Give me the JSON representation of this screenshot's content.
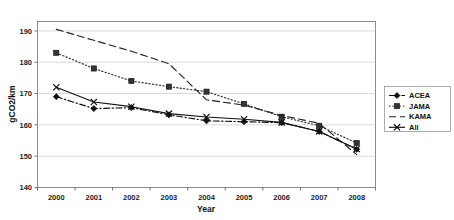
{
  "chart_data": {
    "type": "line",
    "title": "",
    "xlabel": "Year",
    "ylabel": "gCO2/km",
    "x": [
      2000,
      2001,
      2002,
      2003,
      2004,
      2005,
      2006,
      2007,
      2008
    ],
    "xtick_labels": [
      "2000",
      "2001",
      "2002",
      "2003",
      "2004",
      "2005",
      "2006",
      "2007",
      "2008"
    ],
    "ytick_labels": [
      "140",
      "150",
      "160",
      "170",
      "180",
      "190"
    ],
    "yticks": [
      140,
      150,
      160,
      170,
      180,
      190
    ],
    "ylim": [
      140,
      193
    ],
    "grid": "horizontal",
    "legend_position": "right",
    "series": [
      {
        "name": "ACEA",
        "marker": "diamond",
        "linestyle": "dashdot",
        "color": "#111111",
        "values": [
          169.0,
          165.2,
          165.5,
          163.2,
          161.3,
          161.0,
          160.7,
          157.9,
          152.2
        ]
      },
      {
        "name": "JAMA",
        "marker": "square",
        "linestyle": "dotted",
        "color": "#333333",
        "values": [
          183.0,
          178.0,
          174.0,
          172.2,
          170.6,
          166.7,
          162.6,
          159.7,
          154.2
        ]
      },
      {
        "name": "KAMA",
        "marker": "none",
        "linestyle": "dashed",
        "color": "#222222",
        "values": [
          190.5,
          187.0,
          183.5,
          179.5,
          168.0,
          166.3,
          163.0,
          160.5,
          150.5
        ]
      },
      {
        "name": "All",
        "marker": "x",
        "linestyle": "solid",
        "color": "#111111",
        "values": [
          172.0,
          167.3,
          165.8,
          163.6,
          162.5,
          161.8,
          160.8,
          157.9,
          152.3
        ]
      }
    ]
  },
  "legend": {
    "items": [
      {
        "label": "ACEA"
      },
      {
        "label": "JAMA"
      },
      {
        "label": "KAMA"
      },
      {
        "label": "All"
      }
    ]
  }
}
